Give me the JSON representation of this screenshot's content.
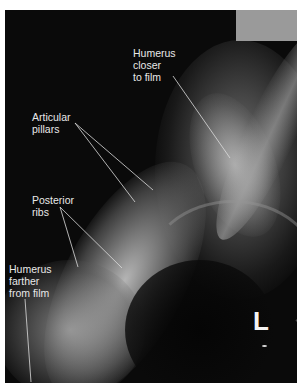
{
  "figure": {
    "side_marker": "L",
    "labels": [
      {
        "id": "humerus-closer",
        "text": "Humerus\ncloser\nto film"
      },
      {
        "id": "articular-pillars",
        "text": "Articular\npillars"
      },
      {
        "id": "posterior-ribs",
        "text": "Posterior\nribs"
      },
      {
        "id": "humerus-farther",
        "text": "Humerus\nfarther\nfrom film"
      }
    ],
    "colors": {
      "background": "#0a0a0a",
      "label_text": "#e8e8e8",
      "marker_box": "#9a9a9a",
      "leader_line": "#dcdcdc"
    }
  }
}
